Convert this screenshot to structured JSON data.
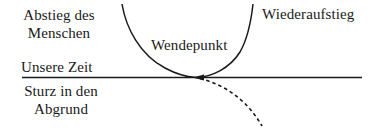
{
  "diagram": {
    "type": "turning-point-schematic",
    "labels": {
      "descent": "Abstieg des Menschen",
      "descent_line1": "Abstieg des",
      "descent_line2": "Menschen",
      "reascent": "Wiederaufstieg",
      "turning_point": "Wendepunkt",
      "present": "Unsere Zeit",
      "fall": "Sturz in den Abgrund",
      "fall_line1": "Sturz in den",
      "fall_line2": "Abgrund"
    },
    "elements": {
      "time_line": {
        "style": "solid",
        "color": "#1a1a1a"
      },
      "u_curve": {
        "style": "solid",
        "color": "#1a1a1a"
      },
      "fall_curve": {
        "style": "dashed",
        "color": "#1a1a1a"
      }
    }
  }
}
